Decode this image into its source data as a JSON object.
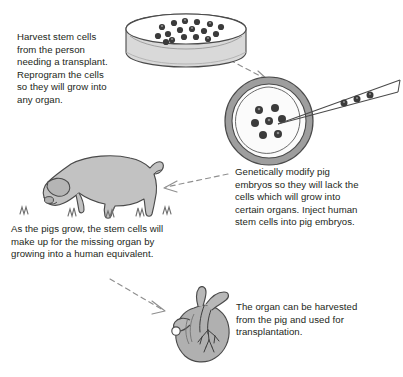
{
  "diagram": {
    "background_color": "#ffffff",
    "text_color": "#231f20",
    "arrow_color": "#8a8a8a",
    "ink_color": "#4a4a4a",
    "fill_gray": "#b3b3b3",
    "cell_color": "#3a3a3a"
  },
  "steps": [
    {
      "id": "harvest",
      "caption": "Harvest stem cells\nfrom the person\nneeding a transplant.\nReprogram the cells\nso they will grow into\nany organ.",
      "illustration": "petri-dish-with-stem-cells",
      "cell_count": 17
    },
    {
      "id": "modify",
      "caption": "Genetically modify pig\nembryos so they will lack the\ncells which will grow into\ncertain organs. Inject human\nstem cells into pig embryos.",
      "illustration": "pig-embryo-with-injection-pipette",
      "embryo_cell_count": 7,
      "pipette_cell_count": 3
    },
    {
      "id": "grow",
      "caption": "As the pigs grow, the stem cells will\nmake up for the missing organ by\ngrowing into a human equivalent.",
      "illustration": "grazing-pig-in-grass",
      "grass_tuft_count": 5
    },
    {
      "id": "organ",
      "caption": "The organ can be harvested\nfrom the pig and used for\ntransplantation.",
      "illustration": "human-heart"
    }
  ],
  "arrows": [
    {
      "id": "dish-to-embryo",
      "from": "harvest",
      "to": "modify",
      "style": "dashed",
      "direction": "down-right"
    },
    {
      "id": "embryo-to-pig",
      "from": "modify",
      "to": "grow",
      "style": "dashed",
      "direction": "left"
    },
    {
      "id": "pig-to-heart",
      "from": "grow",
      "to": "organ",
      "style": "dashed",
      "direction": "down-right"
    }
  ]
}
